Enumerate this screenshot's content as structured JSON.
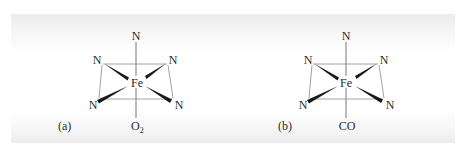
{
  "figure": {
    "background_colors": {
      "edge": "#ececec",
      "center": "#ffffff",
      "ink": "#2a2a2a"
    },
    "panels": [
      {
        "id": "a",
        "label": "(a)",
        "metal": "Fe",
        "top_ligand": "N",
        "equatorial_ligands": [
          "N",
          "N",
          "N",
          "N"
        ],
        "bottom_ligand": "O",
        "bottom_ligand_subscript": "2",
        "bottom_ligand_full": "O2"
      },
      {
        "id": "b",
        "label": "(b)",
        "metal": "Fe",
        "top_ligand": "N",
        "equatorial_ligands": [
          "N",
          "N",
          "N",
          "N"
        ],
        "bottom_ligand": "CO",
        "bottom_ligand_subscript": "",
        "bottom_ligand_full": "CO"
      }
    ]
  }
}
